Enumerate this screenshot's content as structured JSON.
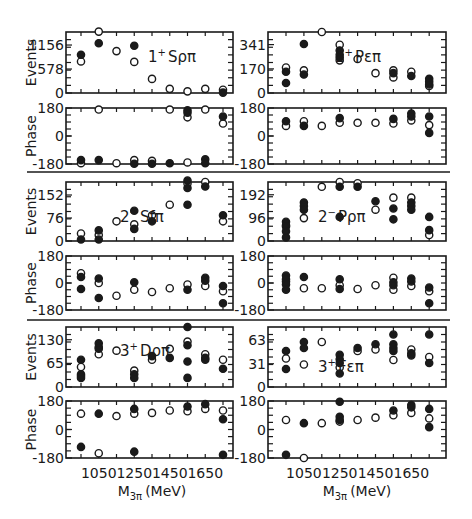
{
  "figure": {
    "x_ticks": [
      1050,
      1250,
      1450,
      1650
    ],
    "x_label_main": "M",
    "x_label_sub": "3π",
    "x_label_unit": "(MeV)",
    "events_label": "Events",
    "phase_label": "Phase",
    "phase_ticks": [
      "180",
      "0",
      "-180"
    ]
  },
  "chart_data": [
    {
      "type": "scatter",
      "title": "1+ Sρπ",
      "panel": "events",
      "ylabel": "Events",
      "xlabel": "M3π (MeV)",
      "yticks": [
        0,
        578,
        1156
      ],
      "ylim": [
        0,
        1470
      ],
      "xlim": [
        900,
        1800
      ],
      "filled": [
        [
          950,
          920
        ],
        [
          1050,
          1200
        ],
        [
          1250,
          1140
        ]
      ],
      "open": [
        [
          950,
          760
        ],
        [
          1050,
          1480
        ],
        [
          1150,
          1010
        ],
        [
          1250,
          750
        ],
        [
          1350,
          340
        ],
        [
          1450,
          100
        ],
        [
          1550,
          40
        ],
        [
          1650,
          100
        ],
        [
          1750,
          80
        ]
      ],
      "filled_extra": [
        [
          1750,
          10
        ]
      ]
    },
    {
      "type": "scatter",
      "title": "1+ Sρπ phase",
      "panel": "phase",
      "ylabel": "Phase",
      "yticks": [
        -180,
        0,
        180
      ],
      "ylim": [
        -180,
        180
      ],
      "xlim": [
        900,
        1800
      ],
      "filled": [
        [
          950,
          -155
        ],
        [
          1050,
          -155
        ],
        [
          1250,
          -178
        ],
        [
          1350,
          -178
        ],
        [
          1450,
          -175
        ],
        [
          1550,
          165
        ],
        [
          1550,
          150
        ],
        [
          1650,
          -150
        ],
        [
          1650,
          -175
        ],
        [
          1750,
          125
        ]
      ],
      "open": [
        [
          950,
          -175
        ],
        [
          1050,
          170
        ],
        [
          1150,
          -175
        ],
        [
          1250,
          -155
        ],
        [
          1350,
          -160
        ],
        [
          1450,
          170
        ],
        [
          1550,
          -170
        ],
        [
          1550,
          120
        ],
        [
          1650,
          170
        ],
        [
          1750,
          80
        ]
      ]
    },
    {
      "type": "scatter",
      "title": "1+ Pεπ",
      "panel": "events",
      "ylabel": "Events",
      "yticks": [
        0,
        170,
        341
      ],
      "ylim": [
        0,
        430
      ],
      "xlim": [
        900,
        1800
      ],
      "filled": [
        [
          950,
          150
        ],
        [
          950,
          70
        ],
        [
          1050,
          345
        ],
        [
          1050,
          130
        ],
        [
          1250,
          300
        ],
        [
          1250,
          270
        ],
        [
          1250,
          250
        ],
        [
          1550,
          140
        ],
        [
          1650,
          120
        ],
        [
          1750,
          100
        ],
        [
          1750,
          80
        ],
        [
          1750,
          60
        ]
      ],
      "open": [
        [
          950,
          180
        ],
        [
          1050,
          160
        ],
        [
          1150,
          430
        ],
        [
          1250,
          340
        ],
        [
          1250,
          230
        ],
        [
          1350,
          240
        ],
        [
          1450,
          140
        ],
        [
          1550,
          160
        ],
        [
          1550,
          110
        ],
        [
          1650,
          150
        ],
        [
          1750,
          50
        ]
      ]
    },
    {
      "type": "scatter",
      "title": "1+ Pεπ phase",
      "panel": "phase",
      "ylabel": "Phase",
      "yticks": [
        -180,
        0,
        180
      ],
      "ylim": [
        -180,
        180
      ],
      "xlim": [
        900,
        1800
      ],
      "filled": [
        [
          950,
          95
        ],
        [
          1050,
          65
        ],
        [
          1250,
          115
        ],
        [
          1550,
          110
        ],
        [
          1650,
          145
        ],
        [
          1650,
          125
        ],
        [
          1750,
          125
        ],
        [
          1750,
          20
        ]
      ],
      "open": [
        [
          950,
          65
        ],
        [
          1050,
          95
        ],
        [
          1150,
          65
        ],
        [
          1250,
          85
        ],
        [
          1350,
          85
        ],
        [
          1450,
          85
        ],
        [
          1550,
          80
        ],
        [
          1650,
          100
        ],
        [
          1750,
          70
        ]
      ]
    },
    {
      "type": "scatter",
      "title": "2- Sfπ",
      "panel": "events",
      "ylabel": "Events",
      "yticks": [
        0,
        76,
        152
      ],
      "ylim": [
        0,
        195
      ],
      "xlim": [
        900,
        1800
      ],
      "filled": [
        [
          950,
          5
        ],
        [
          1050,
          35
        ],
        [
          1050,
          5
        ],
        [
          1250,
          100
        ],
        [
          1250,
          40
        ],
        [
          1350,
          65
        ],
        [
          1550,
          200
        ],
        [
          1550,
          175
        ],
        [
          1550,
          120
        ],
        [
          1650,
          180
        ],
        [
          1750,
          85
        ]
      ],
      "open": [
        [
          950,
          25
        ],
        [
          1050,
          20
        ],
        [
          1150,
          65
        ],
        [
          1250,
          55
        ],
        [
          1350,
          85
        ],
        [
          1450,
          120
        ],
        [
          1550,
          190
        ],
        [
          1650,
          195
        ],
        [
          1750,
          65
        ]
      ]
    },
    {
      "type": "scatter",
      "title": "2- Sfπ phase",
      "panel": "phase",
      "ylabel": "Phase",
      "yticks": [
        -180,
        0,
        180
      ],
      "ylim": [
        -180,
        180
      ],
      "xlim": [
        900,
        1800
      ],
      "filled": [
        [
          950,
          40
        ],
        [
          950,
          -40
        ],
        [
          1050,
          30
        ],
        [
          1050,
          -100
        ],
        [
          1250,
          5
        ],
        [
          1550,
          -45
        ],
        [
          1650,
          35
        ],
        [
          1650,
          15
        ],
        [
          1750,
          -20
        ],
        [
          1750,
          -135
        ]
      ],
      "open": [
        [
          950,
          65
        ],
        [
          1050,
          0
        ],
        [
          1150,
          -85
        ],
        [
          1250,
          -45
        ],
        [
          1350,
          -60
        ],
        [
          1450,
          -35
        ],
        [
          1550,
          -10
        ],
        [
          1650,
          -20
        ],
        [
          1750,
          -55
        ]
      ]
    },
    {
      "type": "scatter",
      "title": "2- Pρπ",
      "panel": "events",
      "ylabel": "Events",
      "yticks": [
        0,
        96,
        192
      ],
      "ylim": [
        0,
        245
      ],
      "xlim": [
        900,
        1800
      ],
      "filled": [
        [
          950,
          80
        ],
        [
          950,
          60
        ],
        [
          950,
          40
        ],
        [
          950,
          15
        ],
        [
          1050,
          160
        ],
        [
          1050,
          145
        ],
        [
          1050,
          130
        ],
        [
          1250,
          225
        ],
        [
          1250,
          100
        ],
        [
          1350,
          225
        ],
        [
          1450,
          165
        ],
        [
          1550,
          135
        ],
        [
          1550,
          90
        ],
        [
          1650,
          160
        ],
        [
          1650,
          145
        ],
        [
          1650,
          130
        ],
        [
          1750,
          100
        ],
        [
          1750,
          45
        ]
      ],
      "open": [
        [
          950,
          65
        ],
        [
          1050,
          95
        ],
        [
          1150,
          225
        ],
        [
          1250,
          245
        ],
        [
          1350,
          240
        ],
        [
          1450,
          130
        ],
        [
          1550,
          180
        ],
        [
          1650,
          180
        ],
        [
          1750,
          25
        ]
      ]
    },
    {
      "type": "scatter",
      "title": "2- Pρπ phase",
      "panel": "phase",
      "ylabel": "Phase",
      "yticks": [
        -180,
        0,
        180
      ],
      "ylim": [
        -180,
        180
      ],
      "xlim": [
        900,
        1800
      ],
      "filled": [
        [
          950,
          50
        ],
        [
          950,
          25
        ],
        [
          950,
          -10
        ],
        [
          950,
          -45
        ],
        [
          1050,
          40
        ],
        [
          1250,
          25
        ],
        [
          1250,
          -40
        ],
        [
          1550,
          5
        ],
        [
          1550,
          -15
        ],
        [
          1650,
          30
        ],
        [
          1650,
          10
        ],
        [
          1750,
          -30
        ],
        [
          1750,
          -135
        ]
      ],
      "open": [
        [
          950,
          10
        ],
        [
          1050,
          -35
        ],
        [
          1150,
          -35
        ],
        [
          1250,
          -15
        ],
        [
          1350,
          -40
        ],
        [
          1450,
          -15
        ],
        [
          1550,
          35
        ],
        [
          1550,
          -45
        ],
        [
          1650,
          -20
        ],
        [
          1750,
          -55
        ]
      ]
    },
    {
      "type": "scatter",
      "title": "3+ Dρπ",
      "panel": "events",
      "ylabel": "Events",
      "yticks": [
        0,
        65,
        130
      ],
      "ylim": [
        0,
        165
      ],
      "xlim": [
        900,
        1800
      ],
      "filled": [
        [
          950,
          75
        ],
        [
          950,
          35
        ],
        [
          950,
          30
        ],
        [
          950,
          25
        ],
        [
          1050,
          120
        ],
        [
          1050,
          110
        ],
        [
          1050,
          105
        ],
        [
          1250,
          35
        ],
        [
          1250,
          25
        ],
        [
          1350,
          85
        ],
        [
          1450,
          80
        ],
        [
          1550,
          165
        ],
        [
          1550,
          115
        ],
        [
          1550,
          70
        ],
        [
          1550,
          25
        ],
        [
          1650,
          80
        ],
        [
          1650,
          75
        ],
        [
          1750,
          50
        ]
      ],
      "open": [
        [
          950,
          55
        ],
        [
          1050,
          90
        ],
        [
          1150,
          100
        ],
        [
          1250,
          45
        ],
        [
          1350,
          75
        ],
        [
          1450,
          105
        ],
        [
          1550,
          125
        ],
        [
          1650,
          90
        ],
        [
          1750,
          75
        ]
      ]
    },
    {
      "type": "scatter",
      "title": "3+ Dρπ phase",
      "panel": "phase",
      "ylabel": "Phase",
      "yticks": [
        -180,
        0,
        180
      ],
      "ylim": [
        -180,
        180
      ],
      "xlim": [
        900,
        1800
      ],
      "filled": [
        [
          950,
          -110
        ],
        [
          1050,
          100
        ],
        [
          1250,
          130
        ],
        [
          1250,
          -140
        ],
        [
          1550,
          145
        ],
        [
          1650,
          160
        ],
        [
          1750,
          65
        ],
        [
          1750,
          -160
        ]
      ],
      "open": [
        [
          950,
          100
        ],
        [
          1050,
          -150
        ],
        [
          1150,
          85
        ],
        [
          1250,
          100
        ],
        [
          1350,
          105
        ],
        [
          1450,
          120
        ],
        [
          1550,
          115
        ],
        [
          1650,
          130
        ],
        [
          1750,
          120
        ]
      ]
    },
    {
      "type": "scatter",
      "title": "3+ Fεπ",
      "panel": "events",
      "ylabel": "Events",
      "yticks": [
        0,
        31,
        63
      ],
      "ylim": [
        0,
        80
      ],
      "xlim": [
        900,
        1800
      ],
      "filled": [
        [
          950,
          48
        ],
        [
          950,
          24
        ],
        [
          1050,
          60
        ],
        [
          1050,
          52
        ],
        [
          1250,
          43
        ],
        [
          1250,
          37
        ],
        [
          1250,
          32
        ],
        [
          1250,
          18
        ],
        [
          1350,
          52
        ],
        [
          1450,
          57
        ],
        [
          1550,
          70
        ],
        [
          1550,
          57
        ],
        [
          1550,
          52
        ],
        [
          1550,
          48
        ],
        [
          1650,
          45
        ],
        [
          1650,
          42
        ],
        [
          1750,
          70
        ],
        [
          1750,
          32
        ]
      ],
      "open": [
        [
          950,
          38
        ],
        [
          1050,
          30
        ],
        [
          1150,
          60
        ],
        [
          1250,
          26
        ],
        [
          1350,
          48
        ],
        [
          1450,
          50
        ],
        [
          1550,
          36
        ],
        [
          1650,
          50
        ],
        [
          1750,
          40
        ]
      ]
    },
    {
      "type": "scatter",
      "title": "3+ Fεπ phase",
      "panel": "phase",
      "ylabel": "Phase",
      "yticks": [
        -180,
        0,
        180
      ],
      "ylim": [
        -180,
        180
      ],
      "xlim": [
        900,
        1800
      ],
      "filled": [
        [
          950,
          -160
        ],
        [
          1050,
          40
        ],
        [
          1250,
          175
        ],
        [
          1250,
          80
        ],
        [
          1250,
          60
        ],
        [
          1550,
          120
        ],
        [
          1650,
          155
        ],
        [
          1650,
          140
        ],
        [
          1750,
          130
        ],
        [
          1750,
          15
        ]
      ],
      "open": [
        [
          950,
          60
        ],
        [
          1050,
          -180
        ],
        [
          1150,
          40
        ],
        [
          1250,
          50
        ],
        [
          1350,
          60
        ],
        [
          1450,
          75
        ],
        [
          1550,
          90
        ],
        [
          1650,
          105
        ],
        [
          1750,
          70
        ]
      ]
    }
  ]
}
